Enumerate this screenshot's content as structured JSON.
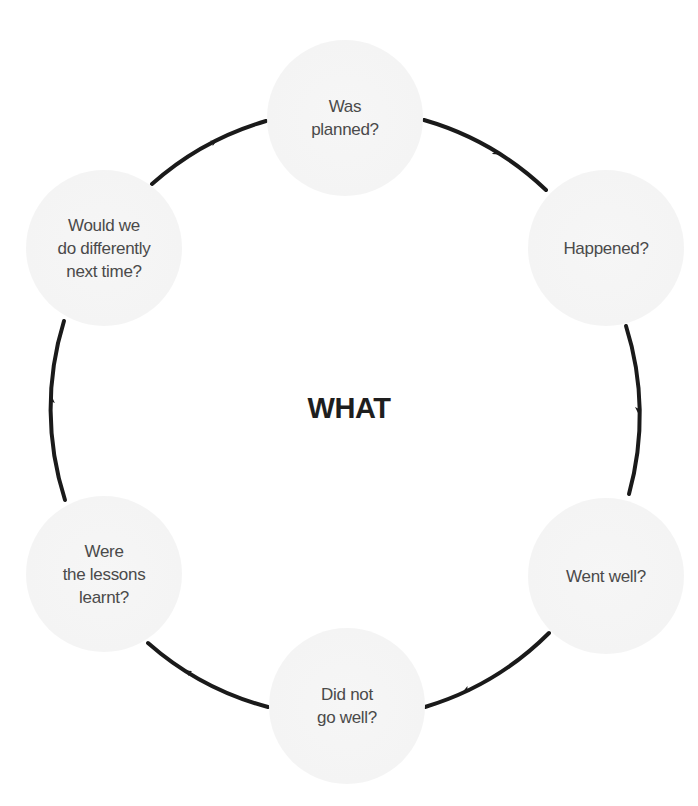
{
  "diagram": {
    "type": "cycle",
    "center_label": "WHAT",
    "direction": "clockwise",
    "nodes": [
      {
        "label": "Was\nplanned?"
      },
      {
        "label": "Happened?"
      },
      {
        "label": "Went well?"
      },
      {
        "label": "Did not\ngo well?"
      },
      {
        "label": "Were\nthe lessons\nlearnt?"
      },
      {
        "label": "Would we\ndo differently\nnext time?"
      }
    ],
    "colors": {
      "arrow": "#1a1a1a",
      "node_fill": "#f5f5f5",
      "node_text": "#4a4a4a",
      "center_text": "#1e1e1e"
    }
  }
}
